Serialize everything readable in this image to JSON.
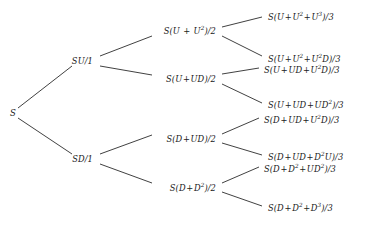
{
  "diagram": {
    "type": "binomial-tree",
    "title": "",
    "root": {
      "id": "root",
      "label": "S",
      "x": 10,
      "y": 113
    },
    "level1": [
      {
        "id": "n-u",
        "label": "SU/1",
        "x": 93,
        "y": 61,
        "anchor": "end"
      },
      {
        "id": "n-d",
        "label": "SD/1",
        "x": 93,
        "y": 159,
        "anchor": "end"
      }
    ],
    "level2": [
      {
        "id": "n-uu",
        "label": "S(U + U²)/2",
        "x": 216,
        "y": 31,
        "anchor": "end"
      },
      {
        "id": "n-ud",
        "label": "S(U+UD)/2",
        "x": 216,
        "y": 79,
        "anchor": "end"
      },
      {
        "id": "n-du",
        "label": "S(D+UD)/2",
        "x": 216,
        "y": 139,
        "anchor": "end"
      },
      {
        "id": "n-dd",
        "label": "S(D+D²)/2",
        "x": 216,
        "y": 188,
        "anchor": "end"
      }
    ],
    "leaves": [
      {
        "id": "leaf-1",
        "label": "S(U+U²+U³)/3",
        "x": 268,
        "y": 17,
        "anchor": "start"
      },
      {
        "id": "leaf-2",
        "label": "S(U+U²+U²D)/3",
        "x": 268,
        "y": 59,
        "anchor": "start"
      },
      {
        "id": "leaf-3",
        "label": "S(U+UD+U²D)/3",
        "x": 264,
        "y": 70,
        "anchor": "start"
      },
      {
        "id": "leaf-4",
        "label": "S(U+UD+UD²)/3",
        "x": 268,
        "y": 105,
        "anchor": "start"
      },
      {
        "id": "leaf-5",
        "label": "S(D+UD+U²D)/3",
        "x": 264,
        "y": 120,
        "anchor": "start"
      },
      {
        "id": "leaf-6",
        "label": "S(D+UD+D²U)/3",
        "x": 268,
        "y": 157,
        "anchor": "start"
      },
      {
        "id": "leaf-7",
        "label": "S(D+D²+UD²)/3",
        "x": 264,
        "y": 169,
        "anchor": "start"
      },
      {
        "id": "leaf-8",
        "label": "S(D+D²+D³)/3",
        "x": 268,
        "y": 208,
        "anchor": "start"
      }
    ],
    "edges": [
      {
        "id": "e-root-u",
        "from": "root",
        "to": "n-u",
        "x1": 18,
        "y1": 108,
        "x2": 72,
        "y2": 66
      },
      {
        "id": "e-root-d",
        "from": "root",
        "to": "n-d",
        "x1": 18,
        "y1": 118,
        "x2": 72,
        "y2": 154
      },
      {
        "id": "e-u-uu",
        "from": "n-u",
        "to": "n-uu",
        "x1": 100,
        "y1": 56,
        "x2": 152,
        "y2": 36
      },
      {
        "id": "e-u-ud",
        "from": "n-u",
        "to": "n-ud",
        "x1": 100,
        "y1": 66,
        "x2": 152,
        "y2": 75
      },
      {
        "id": "e-d-du",
        "from": "n-d",
        "to": "n-du",
        "x1": 100,
        "y1": 154,
        "x2": 152,
        "y2": 135
      },
      {
        "id": "e-d-dd",
        "from": "n-d",
        "to": "n-dd",
        "x1": 100,
        "y1": 164,
        "x2": 152,
        "y2": 183
      },
      {
        "id": "e-uu-l1",
        "from": "n-uu",
        "to": "leaf-1",
        "x1": 222,
        "y1": 27,
        "x2": 262,
        "y2": 17
      },
      {
        "id": "e-uu-l2",
        "from": "n-uu",
        "to": "leaf-2",
        "x1": 222,
        "y1": 36,
        "x2": 262,
        "y2": 56
      },
      {
        "id": "e-ud-l3",
        "from": "n-ud",
        "to": "leaf-3",
        "x1": 222,
        "y1": 74,
        "x2": 259,
        "y2": 68
      },
      {
        "id": "e-ud-l4",
        "from": "n-ud",
        "to": "leaf-4",
        "x1": 222,
        "y1": 84,
        "x2": 262,
        "y2": 103
      },
      {
        "id": "e-du-l5",
        "from": "n-du",
        "to": "leaf-5",
        "x1": 222,
        "y1": 134,
        "x2": 259,
        "y2": 118
      },
      {
        "id": "e-du-l6",
        "from": "n-du",
        "to": "leaf-6",
        "x1": 222,
        "y1": 143,
        "x2": 262,
        "y2": 155
      },
      {
        "id": "e-dd-l7",
        "from": "n-dd",
        "to": "leaf-7",
        "x1": 222,
        "y1": 183,
        "x2": 259,
        "y2": 167
      },
      {
        "id": "e-dd-l8",
        "from": "n-dd",
        "to": "leaf-8",
        "x1": 222,
        "y1": 192,
        "x2": 262,
        "y2": 206
      }
    ],
    "style": {
      "line_color": "#2b2b2b",
      "text_color": "#1a1a1a",
      "background": "#ffffff"
    }
  }
}
